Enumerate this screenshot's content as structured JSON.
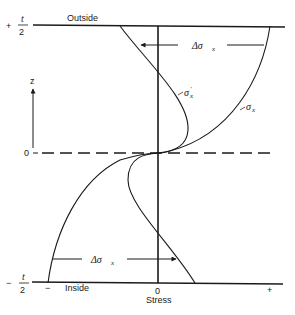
{
  "diagram": {
    "type": "stress-distribution-through-thickness",
    "boundaries": {
      "top": {
        "z_label_num": "t",
        "z_label_den": "2",
        "z_label_sign": "+",
        "side_label": "Outside"
      },
      "bottom": {
        "z_label_num": "t",
        "z_label_den": "2",
        "z_label_sign": "−",
        "side_label": "Inside"
      }
    },
    "z_axis": {
      "label": "z",
      "origin_label": "0"
    },
    "stress_axis": {
      "title": "Stress",
      "zero_label": "0",
      "negative_label": "−",
      "positive_label": "+"
    },
    "curves": [
      {
        "id": "sigma_x",
        "label": "σ",
        "subscript": "x",
        "prime": ""
      },
      {
        "id": "sigma_x_prime",
        "label": "σ",
        "subscript": "x",
        "prime": "′"
      }
    ],
    "annotations": [
      {
        "id": "delta_top",
        "label": "Δσ",
        "subscript": "x",
        "direction": "left"
      },
      {
        "id": "delta_bottom",
        "label": "Δσ",
        "subscript": "x",
        "direction": "right"
      }
    ]
  }
}
